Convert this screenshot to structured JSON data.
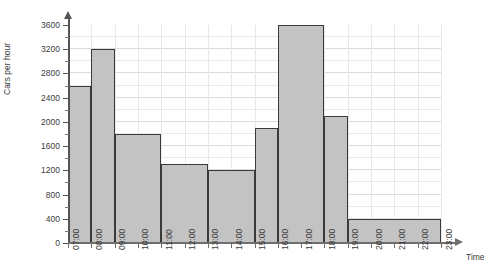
{
  "chart_data": {
    "type": "bar",
    "title": "",
    "xlabel": "Time",
    "ylabel": "Cars per hour",
    "ylim": [
      0,
      3600
    ],
    "xlim": [
      "07:00",
      "23:00"
    ],
    "grid": true,
    "legend": "none",
    "y_ticks": [
      0,
      400,
      800,
      1200,
      1600,
      2000,
      2400,
      2800,
      3200,
      3600
    ],
    "y_tick_labels": [
      "0",
      "400",
      "800",
      "1200",
      "1600",
      "2000",
      "2400",
      "2800",
      "3200",
      "3600"
    ],
    "y_minor_tick_step": 200,
    "x_ticks": [
      "07:00",
      "08:00",
      "09:00",
      "10:00",
      "11:00",
      "12:00",
      "13:00",
      "14:00",
      "15:00",
      "16:00",
      "17:00",
      "18:00",
      "19:00",
      "20:00",
      "21:00",
      "22:00",
      "23:00"
    ],
    "bars": [
      {
        "start": "07:00",
        "end": "08:00",
        "value": 2600
      },
      {
        "start": "08:00",
        "end": "09:00",
        "value": 3200
      },
      {
        "start": "09:00",
        "end": "11:00",
        "value": 1800
      },
      {
        "start": "11:00",
        "end": "13:00",
        "value": 1300
      },
      {
        "start": "13:00",
        "end": "15:00",
        "value": 1200
      },
      {
        "start": "15:00",
        "end": "16:00",
        "value": 1900
      },
      {
        "start": "16:00",
        "end": "18:00",
        "value": 3600
      },
      {
        "start": "18:00",
        "end": "19:00",
        "value": 2100
      },
      {
        "start": "19:00",
        "end": "23:00",
        "value": 400
      }
    ],
    "categories": [
      "07:00-08:00",
      "08:00-09:00",
      "09:00-11:00",
      "11:00-13:00",
      "13:00-15:00",
      "15:00-16:00",
      "16:00-18:00",
      "18:00-19:00",
      "19:00-23:00"
    ],
    "values": [
      2600,
      3200,
      1800,
      1300,
      1200,
      1900,
      3600,
      2100,
      400
    ],
    "colors": {
      "bar_fill": "#c3c3c3",
      "bar_border": "#3a3a3a",
      "grid": "#e8e8e8",
      "axis": "#6e6e6e",
      "text": "#3b3b3b"
    }
  }
}
